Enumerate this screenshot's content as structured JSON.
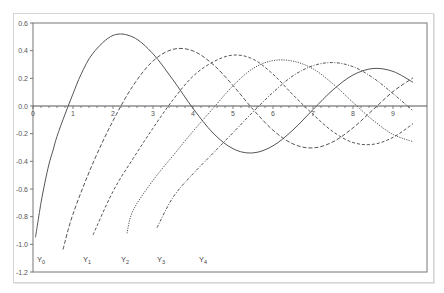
{
  "chart_data": {
    "type": "line",
    "title": "",
    "xlabel": "",
    "ylabel": "",
    "xlim": [
      0,
      9.5
    ],
    "ylim": [
      -1.2,
      0.6
    ],
    "grid": false,
    "legend_position": "inline-bottom",
    "x_ticks": [
      "0",
      "1",
      "2",
      "3",
      "4",
      "5",
      "6",
      "7",
      "8",
      "9"
    ],
    "y_ticks": [
      "0.6",
      "0.4",
      "0.2",
      "0.0",
      "-0.2",
      "-0.4",
      "-0.6",
      "-0.8",
      "-1.0",
      "-1.2"
    ],
    "series": [
      {
        "name": "Y0",
        "label_main": "Y",
        "label_sub": "0",
        "style": "solid",
        "x": [
          0.06,
          0.1,
          0.2,
          0.3,
          0.4,
          0.5,
          0.6,
          0.8,
          1.0,
          1.2,
          1.5,
          2.0,
          2.5,
          3.0,
          3.5,
          4.0,
          4.5,
          5.0,
          5.5,
          6.0,
          6.5,
          7.0,
          7.5,
          8.0,
          8.5,
          9.0,
          9.5
        ],
        "y": [
          -0.95,
          -0.88,
          -0.7,
          -0.55,
          -0.42,
          -0.32,
          -0.22,
          -0.06,
          0.088,
          0.228,
          0.382,
          0.51,
          0.498,
          0.377,
          0.189,
          -0.017,
          -0.195,
          -0.309,
          -0.339,
          -0.288,
          -0.173,
          -0.026,
          0.117,
          0.224,
          0.271,
          0.25,
          0.171
        ]
      },
      {
        "name": "Y1",
        "label_main": "Y",
        "label_sub": "1",
        "style": "dashed",
        "x": [
          0.75,
          1.0,
          1.5,
          2.0,
          2.5,
          3.0,
          3.5,
          4.0,
          4.5,
          5.0,
          5.5,
          6.0,
          6.5,
          7.0,
          7.5,
          8.0,
          8.5,
          9.0,
          9.5
        ],
        "y": [
          -1.037,
          -0.781,
          -0.412,
          -0.107,
          0.146,
          0.325,
          0.41,
          0.398,
          0.301,
          0.148,
          -0.024,
          -0.175,
          -0.274,
          -0.303,
          -0.259,
          -0.158,
          -0.027,
          0.104,
          0.204
        ]
      },
      {
        "name": "Y2",
        "label_main": "Y",
        "label_sub": "2",
        "style": "dashed-long",
        "x": [
          1.5,
          2.0,
          2.5,
          3.0,
          3.5,
          4.0,
          4.5,
          5.0,
          5.5,
          6.0,
          6.5,
          7.0,
          7.5,
          8.0,
          8.5,
          9.0,
          9.5
        ],
        "y": [
          -0.932,
          -0.617,
          -0.381,
          -0.16,
          0.045,
          0.215,
          0.318,
          0.368,
          0.339,
          0.23,
          0.081,
          -0.06,
          -0.186,
          -0.264,
          -0.277,
          -0.227,
          -0.128
        ]
      },
      {
        "name": "Y3",
        "label_main": "Y",
        "label_sub": "3",
        "style": "dotted",
        "x": [
          2.35,
          2.5,
          3.0,
          3.5,
          4.0,
          4.5,
          5.0,
          5.5,
          6.0,
          6.5,
          7.0,
          7.5,
          8.0,
          8.5,
          9.0,
          9.5
        ],
        "y": [
          -0.92,
          -0.756,
          -0.538,
          -0.359,
          -0.183,
          -0.018,
          0.146,
          0.271,
          0.328,
          0.324,
          0.269,
          0.16,
          0.026,
          -0.103,
          -0.205,
          -0.258
        ]
      },
      {
        "name": "Y4",
        "label_main": "Y",
        "label_sub": "4",
        "style": "dash-dot",
        "x": [
          3.1,
          3.5,
          4.0,
          4.5,
          5.0,
          5.5,
          6.0,
          6.5,
          7.0,
          7.5,
          8.0,
          8.5,
          9.0,
          9.5
        ],
        "y": [
          -0.88,
          -0.66,
          -0.49,
          -0.342,
          -0.193,
          -0.043,
          0.098,
          0.218,
          0.291,
          0.314,
          0.284,
          0.204,
          0.09,
          -0.035
        ]
      }
    ],
    "series_label_positions": [
      0.1,
      1.25,
      2.2,
      3.1,
      4.15
    ]
  }
}
